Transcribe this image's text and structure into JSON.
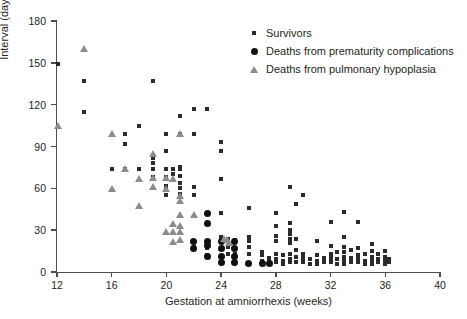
{
  "chart_data": {
    "type": "scatter",
    "title": "",
    "xlabel": "Gestation at amniorrhexis (weeks)",
    "ylabel": "Interval (days)",
    "xlim": [
      12,
      40
    ],
    "ylim": [
      0,
      180
    ],
    "xticks": [
      12,
      16,
      20,
      24,
      28,
      32,
      36,
      40
    ],
    "yticks": [
      0,
      30,
      60,
      90,
      120,
      150,
      180
    ],
    "grid": false,
    "legend_position": "top-right",
    "series": [
      {
        "name": "Survivors",
        "marker": "square",
        "color": "#2b2b2b",
        "points": [
          [
            12.1,
            149
          ],
          [
            14,
            137
          ],
          [
            14,
            115
          ],
          [
            16,
            74
          ],
          [
            17,
            99
          ],
          [
            17,
            92
          ],
          [
            17,
            74
          ],
          [
            18,
            105
          ],
          [
            18,
            74
          ],
          [
            19,
            137
          ],
          [
            19,
            82
          ],
          [
            19,
            78
          ],
          [
            19,
            74
          ],
          [
            19,
            68
          ],
          [
            20,
            99
          ],
          [
            20,
            87
          ],
          [
            20,
            74
          ],
          [
            20,
            68
          ],
          [
            20,
            62
          ],
          [
            20,
            55
          ],
          [
            20.5,
            74
          ],
          [
            20.5,
            70
          ],
          [
            21,
            112
          ],
          [
            21,
            99
          ],
          [
            21,
            75
          ],
          [
            21,
            74
          ],
          [
            21,
            69
          ],
          [
            21,
            64
          ],
          [
            21,
            60
          ],
          [
            21,
            56
          ],
          [
            22,
            117
          ],
          [
            22,
            99
          ],
          [
            22,
            61
          ],
          [
            22,
            55
          ],
          [
            22,
            18
          ],
          [
            23,
            117
          ],
          [
            23,
            22
          ],
          [
            23,
            17
          ],
          [
            23,
            12
          ],
          [
            24,
            93
          ],
          [
            24,
            87
          ],
          [
            24,
            67
          ],
          [
            24,
            42
          ],
          [
            24,
            25
          ],
          [
            24,
            22
          ],
          [
            24,
            17
          ],
          [
            24,
            7
          ],
          [
            24.5,
            24
          ],
          [
            24.5,
            23
          ],
          [
            24.5,
            18
          ],
          [
            24.5,
            13
          ],
          [
            25,
            23
          ],
          [
            25,
            13
          ],
          [
            26,
            46
          ],
          [
            26,
            25
          ],
          [
            26,
            22
          ],
          [
            26,
            18
          ],
          [
            26,
            13
          ],
          [
            27,
            14
          ],
          [
            27,
            12
          ],
          [
            27,
            8
          ],
          [
            27,
            6
          ],
          [
            27.5,
            10
          ],
          [
            27.5,
            7
          ],
          [
            28,
            42
          ],
          [
            28,
            33
          ],
          [
            28,
            26
          ],
          [
            28,
            22
          ],
          [
            28,
            13
          ],
          [
            28,
            9
          ],
          [
            28,
            7
          ],
          [
            28.5,
            12
          ],
          [
            28.5,
            8
          ],
          [
            28.5,
            6
          ],
          [
            29,
            61
          ],
          [
            29,
            35
          ],
          [
            29,
            30
          ],
          [
            29,
            27
          ],
          [
            29,
            24
          ],
          [
            29,
            21
          ],
          [
            29,
            13
          ],
          [
            29,
            9
          ],
          [
            29,
            7
          ],
          [
            29.5,
            49
          ],
          [
            29.5,
            24
          ],
          [
            29.5,
            16
          ],
          [
            29.5,
            11
          ],
          [
            29.5,
            7
          ],
          [
            30,
            55
          ],
          [
            30,
            13
          ],
          [
            30,
            10
          ],
          [
            30,
            7
          ],
          [
            30.5,
            9
          ],
          [
            30.5,
            6
          ],
          [
            31,
            22
          ],
          [
            31,
            12
          ],
          [
            31,
            8
          ],
          [
            31,
            6
          ],
          [
            31.5,
            10
          ],
          [
            31.5,
            7
          ],
          [
            32,
            36
          ],
          [
            32,
            19
          ],
          [
            32,
            13
          ],
          [
            32,
            10
          ],
          [
            32,
            7
          ],
          [
            32.5,
            14
          ],
          [
            32.5,
            9
          ],
          [
            32.5,
            6
          ],
          [
            33,
            43
          ],
          [
            33,
            25
          ],
          [
            33,
            18
          ],
          [
            33,
            14
          ],
          [
            33,
            11
          ],
          [
            33,
            8
          ],
          [
            33,
            6
          ],
          [
            33.5,
            16
          ],
          [
            33.5,
            10
          ],
          [
            33.5,
            7
          ],
          [
            34,
            36
          ],
          [
            34,
            17
          ],
          [
            34,
            12
          ],
          [
            34,
            9
          ],
          [
            34,
            7
          ],
          [
            34.5,
            13
          ],
          [
            34.5,
            8
          ],
          [
            34.5,
            6
          ],
          [
            35,
            20
          ],
          [
            35,
            15
          ],
          [
            35,
            11
          ],
          [
            35,
            8
          ],
          [
            35,
            6
          ],
          [
            35.5,
            13
          ],
          [
            35.5,
            9
          ],
          [
            35.5,
            7
          ],
          [
            36,
            15
          ],
          [
            36,
            11
          ],
          [
            36,
            8
          ],
          [
            36,
            6
          ],
          [
            36.3,
            9
          ],
          [
            36.3,
            7
          ]
        ]
      },
      {
        "name": "Deaths from prematurity complications",
        "marker": "circle",
        "color": "#111111",
        "points": [
          [
            22,
            22
          ],
          [
            22,
            17
          ],
          [
            23,
            42
          ],
          [
            23,
            35
          ],
          [
            23,
            22
          ],
          [
            23,
            19
          ],
          [
            23,
            11
          ],
          [
            24,
            22
          ],
          [
            24,
            17
          ],
          [
            24,
            11
          ],
          [
            24,
            7
          ],
          [
            25,
            22
          ],
          [
            25,
            17
          ],
          [
            25,
            11
          ],
          [
            25,
            7
          ],
          [
            26,
            6
          ],
          [
            27,
            6
          ],
          [
            27.5,
            6
          ]
        ]
      },
      {
        "name": "Deaths from pulmonary hypoplasia",
        "marker": "triangle",
        "color": "#8c8c8c",
        "points": [
          [
            12.1,
            105
          ],
          [
            14,
            160
          ],
          [
            16,
            99
          ],
          [
            16,
            60
          ],
          [
            17,
            74
          ],
          [
            18,
            67
          ],
          [
            18,
            48
          ],
          [
            19,
            85
          ],
          [
            19,
            68
          ],
          [
            19,
            61
          ],
          [
            20,
            68
          ],
          [
            20,
            60
          ],
          [
            20,
            29
          ],
          [
            20.5,
            67
          ],
          [
            20.5,
            35
          ],
          [
            20.5,
            29
          ],
          [
            20.5,
            22
          ],
          [
            21,
            99
          ],
          [
            21,
            55
          ],
          [
            21,
            51
          ],
          [
            21,
            41
          ],
          [
            21,
            33
          ],
          [
            21,
            29
          ],
          [
            21,
            23
          ],
          [
            22,
            41
          ],
          [
            24.2,
            24
          ],
          [
            24.4,
            23
          ],
          [
            24.6,
            21
          ]
        ]
      }
    ]
  },
  "axis": {
    "y_label": "Interval (days)",
    "x_label": "Gestation at amniorrhexis (weeks)",
    "y_ticks": [
      "0",
      "30",
      "60",
      "90",
      "120",
      "150",
      "180"
    ],
    "x_ticks": [
      "12",
      "16",
      "20",
      "24",
      "28",
      "32",
      "36",
      "40"
    ]
  },
  "legend": {
    "items": [
      {
        "label": "Survivors",
        "marker": "square"
      },
      {
        "label": "Deaths from prematurity complications",
        "marker": "circle"
      },
      {
        "label": "Deaths from pulmonary hypoplasia",
        "marker": "triangle"
      }
    ]
  }
}
